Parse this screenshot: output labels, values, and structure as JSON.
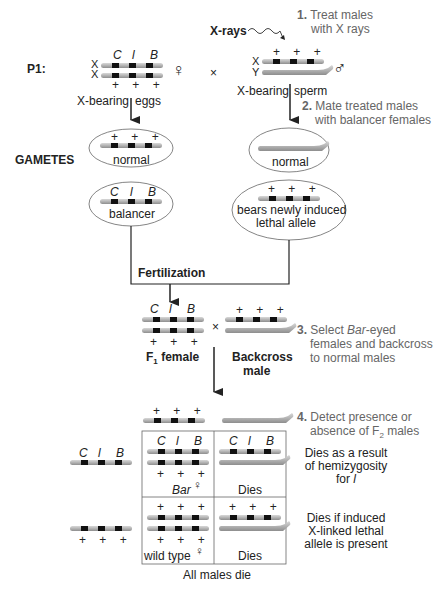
{
  "p1": {
    "label": "P1:",
    "female_loci": [
      "C",
      "l",
      "B"
    ],
    "female_chr": [
      "X",
      "X"
    ],
    "female_plus": "+ + +",
    "female_symbol": "♀",
    "cross": "×",
    "male_plus": "+ + +",
    "male_chr": [
      "X",
      "Y"
    ],
    "male_symbol": "♂",
    "xrays_label": "X-rays",
    "eggs_left": "X-bearing",
    "eggs_right": "eggs",
    "sperm_left": "X-bearing",
    "sperm_right": "sperm"
  },
  "steps": [
    {
      "num": "1.",
      "lines": [
        "Treat males",
        "with X rays"
      ]
    },
    {
      "num": "2.",
      "lines": [
        "Mate treated males",
        "with balancer females"
      ]
    },
    {
      "num": "3.",
      "lines": [
        "Select Bar-eyed",
        "females and backcross",
        "to normal males"
      ]
    },
    {
      "num": "4.",
      "lines": [
        "Detect presence or",
        "absence of F2 males"
      ]
    }
  ],
  "gametes": {
    "label": "GAMETES",
    "egg_normal": {
      "plus": "+ + +",
      "label": "normal"
    },
    "egg_balancer": {
      "loci": [
        "C",
        "l",
        "B"
      ],
      "label": "balancer"
    },
    "sperm_normal": {
      "label": "normal"
    },
    "sperm_lethal": {
      "plus": "+ + +",
      "label_lines": [
        "bears newly induced",
        "lethal allele"
      ]
    }
  },
  "fertilization": "Fertilization",
  "f1": {
    "loci": [
      "C",
      "l",
      "B"
    ],
    "plus": "+ + +",
    "female_label": "F",
    "female_sub": "1",
    "female_suffix": " female",
    "cross": "×",
    "male_plus": "+ + +",
    "male_label_lines": [
      "Backcross",
      "male"
    ]
  },
  "punnett": {
    "top_gamete_plus": "+ + +",
    "left_gametes": [
      {
        "loci": [
          "C",
          "l",
          "B"
        ]
      },
      {
        "plus": "+ + +"
      }
    ],
    "cells": [
      {
        "loci": [
          "C",
          "l",
          "B"
        ],
        "plus": "+ + +",
        "label": "Bar",
        "symbol": "♀"
      },
      {
        "loci": [
          "C",
          "l",
          "B"
        ],
        "label": "Dies"
      },
      {
        "plus_top": "+ + +",
        "plus": "+ + +",
        "label": "wild type",
        "symbol": "♀"
      },
      {
        "plus_top": "+ + +",
        "label": "Dies"
      }
    ],
    "row_notes": [
      [
        "Dies as a result",
        "of hemizygosity",
        "for l"
      ],
      [
        "Dies if induced",
        "X-linked lethal",
        "allele is present"
      ]
    ],
    "footer": "All males die"
  },
  "colors": {
    "chromosome": "#b8b8b8",
    "chromosome_edge": "#8a8a8a",
    "band": "#111111",
    "step_text": "#666666",
    "line": "#222222"
  }
}
